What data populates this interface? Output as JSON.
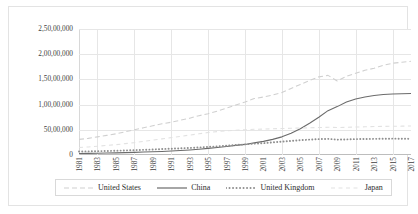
{
  "chart_data": {
    "type": "line",
    "title": "",
    "xlabel": "",
    "ylabel": "",
    "grid": true,
    "legend_position": "bottom",
    "ylim": [
      0,
      25000000
    ],
    "y_ticks": [
      0,
      5000000,
      10000000,
      15000000,
      20000000,
      25000000
    ],
    "y_tick_labels": [
      "0",
      "50,00,000",
      "1,00,00,000",
      "1,50,00,000",
      "2,00,00,000",
      "2,50,00,000"
    ],
    "x": [
      1981,
      1982,
      1983,
      1984,
      1985,
      1986,
      1987,
      1988,
      1989,
      1990,
      1991,
      1992,
      1993,
      1994,
      1995,
      1996,
      1997,
      1998,
      1999,
      2000,
      2001,
      2002,
      2003,
      2004,
      2005,
      2006,
      2007,
      2008,
      2009,
      2010,
      2011,
      2012,
      2013,
      2014,
      2015,
      2016,
      2017
    ],
    "x_tick_labels": [
      "1981",
      "1983",
      "1985",
      "1987",
      "1989",
      "1991",
      "1993",
      "1995",
      "1997",
      "1999",
      "2001",
      "2003",
      "2005",
      "2007",
      "2009",
      "2011",
      "2013",
      "2015",
      "2017"
    ],
    "series": [
      {
        "name": "United States",
        "color": "#d0d0d0",
        "style": "dashed",
        "values": [
          3100000,
          3300000,
          3600000,
          3900000,
          4200000,
          4600000,
          5000000,
          5400000,
          5800000,
          6200000,
          6500000,
          6900000,
          7300000,
          7800000,
          8200000,
          8700000,
          9300000,
          9900000,
          10500000,
          11200000,
          11500000,
          11900000,
          12400000,
          13200000,
          14000000,
          14800000,
          15500000,
          15800000,
          14700000,
          15600000,
          16200000,
          16800000,
          17200000,
          17800000,
          18200000,
          18400000,
          18600000
        ]
      },
      {
        "name": "China",
        "color": "#6b6b6b",
        "style": "solid",
        "values": [
          300000,
          320000,
          350000,
          390000,
          430000,
          480000,
          530000,
          590000,
          640000,
          700000,
          780000,
          880000,
          1000000,
          1150000,
          1320000,
          1500000,
          1700000,
          1900000,
          2100000,
          2400000,
          2700000,
          3100000,
          3600000,
          4300000,
          5200000,
          6300000,
          7500000,
          8800000,
          9600000,
          10500000,
          11100000,
          11500000,
          11800000,
          12000000,
          12100000,
          12150000,
          12200000
        ]
      },
      {
        "name": "United Kingdom",
        "color": "#8f8f8f",
        "style": "dotted",
        "values": [
          700000,
          720000,
          760000,
          800000,
          850000,
          900000,
          960000,
          1030000,
          1100000,
          1180000,
          1250000,
          1320000,
          1400000,
          1500000,
          1600000,
          1720000,
          1850000,
          1980000,
          2100000,
          2250000,
          2350000,
          2500000,
          2650000,
          2800000,
          2950000,
          3050000,
          3150000,
          3200000,
          3050000,
          3100000,
          3150000,
          3180000,
          3200000,
          3220000,
          3250000,
          3230000,
          3200000
        ]
      },
      {
        "name": "Japan",
        "color": "#e2e2e2",
        "style": "dashed-light",
        "values": [
          1500000,
          1600000,
          1750000,
          1900000,
          2050000,
          2250000,
          2450000,
          2700000,
          2950000,
          3200000,
          3450000,
          3700000,
          3950000,
          4200000,
          4450000,
          4650000,
          4800000,
          4900000,
          5000000,
          5100000,
          5150000,
          5200000,
          5250000,
          5300000,
          5350000,
          5400000,
          5450000,
          5500000,
          5450000,
          5500000,
          5550000,
          5600000,
          5650000,
          5680000,
          5700000,
          5720000,
          5750000
        ]
      }
    ]
  },
  "legend": {
    "items": [
      {
        "label": "United States",
        "swatch": "dashed-light-line-swatch"
      },
      {
        "label": "China",
        "swatch": "solid-line-swatch"
      },
      {
        "label": "United Kingdom",
        "swatch": "dotted-line-swatch"
      },
      {
        "label": "Japan",
        "swatch": "faint-dashed-line-swatch"
      }
    ]
  }
}
